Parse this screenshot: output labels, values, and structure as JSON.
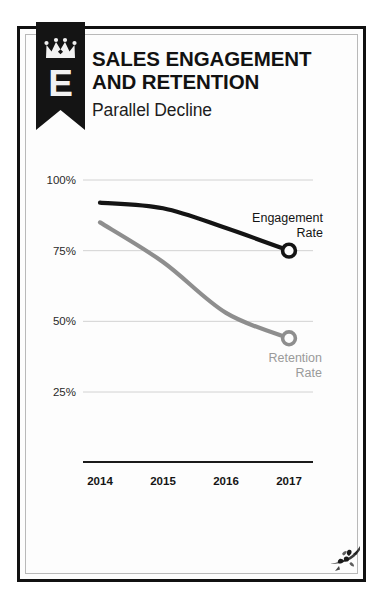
{
  "poster": {
    "badge": {
      "letter": "E",
      "icon": "crown-icon",
      "ribbon_color": "#141414",
      "mark_color": "#f2f2f2"
    },
    "header": {
      "title_line1": "SALES ENGAGEMENT",
      "title_line2": "AND RETENTION",
      "subtitle": "Parallel Decline"
    },
    "ornament": {
      "icon": "corner-flourish-icon",
      "color": "#1a1a1a"
    }
  },
  "chart_data": {
    "type": "line",
    "title": "SALES ENGAGEMENT AND RETENTION",
    "subtitle": "Parallel Decline",
    "xlabel": "",
    "ylabel": "",
    "categories": [
      "2014",
      "2015",
      "2016",
      "2017"
    ],
    "x": [
      2014,
      2015,
      2016,
      2017
    ],
    "ylim": [
      0,
      110
    ],
    "yticks": [
      100,
      75,
      50,
      25
    ],
    "ytick_labels": [
      "100%",
      "75%",
      "50%",
      "25%"
    ],
    "grid": true,
    "grid_axis": "y",
    "legend": "inline-endpoint-annotations",
    "markers": "open-circle-at-last-point",
    "series": [
      {
        "name": "Engagement Rate",
        "label": "Engagement\nRate",
        "label_line1": "Engagement",
        "label_line2": "Rate",
        "color": "#141414",
        "values": [
          92,
          90,
          83,
          75
        ]
      },
      {
        "name": "Retention Rate",
        "label": "Retention\nRate",
        "label_line1": "Retention",
        "label_line2": "Rate",
        "color": "#8e8e8e",
        "values": [
          85,
          71,
          53,
          44
        ]
      }
    ]
  }
}
